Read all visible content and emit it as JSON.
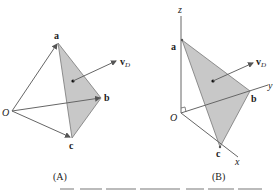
{
  "figure": {
    "panels": [
      {
        "id": "A",
        "caption": "(A)",
        "points": {
          "a": "a",
          "b": "b",
          "c": "c",
          "origin": "O"
        },
        "vector_label": "v",
        "vector_subscript": "D"
      },
      {
        "id": "B",
        "caption": "(B)",
        "points": {
          "a": "a",
          "b": "b",
          "c": "c",
          "origin": "O"
        },
        "axes": {
          "x": "x",
          "y": "y",
          "z": "z"
        },
        "vector_label": "v",
        "vector_subscript": "D"
      }
    ],
    "caption_partial": "Figure caption (cut off)",
    "colors": {
      "face_fill": "#c8c8c8",
      "line": "#555555",
      "text": "#222222"
    }
  }
}
